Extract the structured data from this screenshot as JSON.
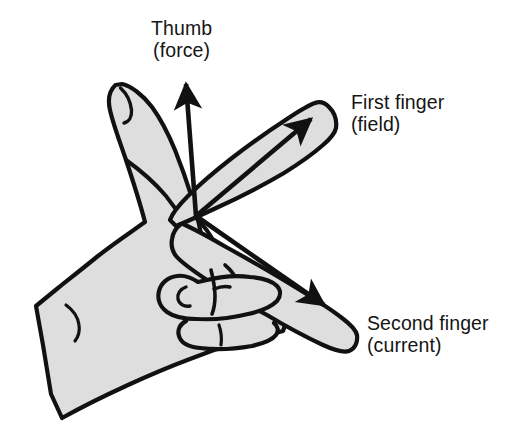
{
  "figure": {
    "background_color": "#ffffff",
    "ink_color": "#111111",
    "hand_fill_color": "#dedede",
    "width": 520,
    "height": 439
  },
  "labels": {
    "thumb": {
      "line1": "Thumb",
      "line2": "(force)",
      "quantity": "force",
      "digit": "Thumb"
    },
    "first_finger": {
      "line1": "First finger",
      "line2": "(field)",
      "quantity": "field",
      "digit": "First finger"
    },
    "second_finger": {
      "line1": "Second finger",
      "line2": "(current)",
      "quantity": "current",
      "digit": "Second finger"
    }
  },
  "arrows": {
    "force": {
      "direction": "up",
      "from": [
        196,
        216
      ],
      "to": [
        186,
        76
      ]
    },
    "field": {
      "direction": "up-right",
      "from": [
        196,
        216
      ],
      "to": [
        318,
        114
      ]
    },
    "current": {
      "direction": "down-right",
      "from": [
        196,
        216
      ],
      "to": [
        331,
        310
      ]
    }
  }
}
